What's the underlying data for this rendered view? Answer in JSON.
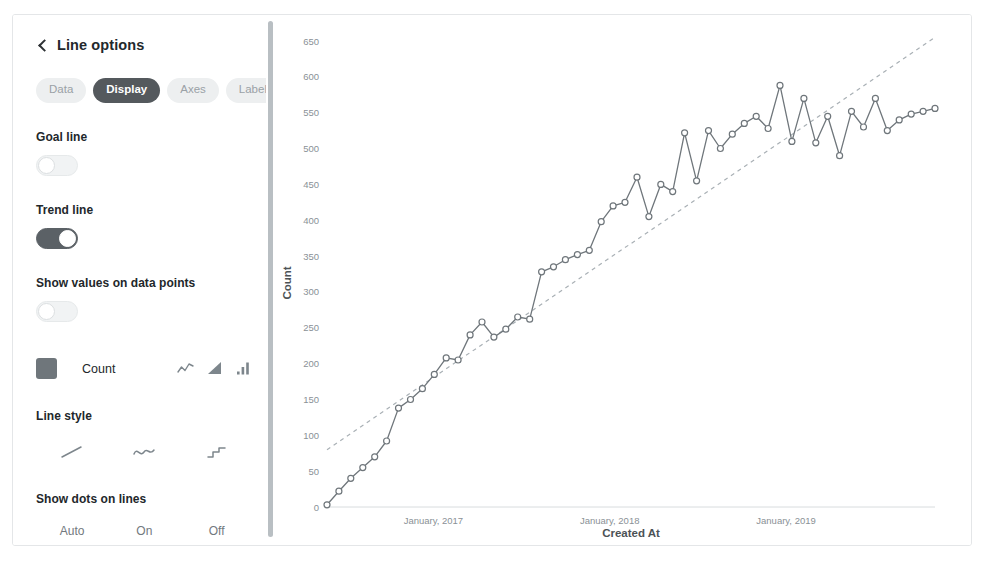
{
  "panel": {
    "title": "Line options",
    "back_icon": "chevron-left-icon",
    "tabs": [
      {
        "label": "Data",
        "active": false
      },
      {
        "label": "Display",
        "active": true
      },
      {
        "label": "Axes",
        "active": false
      },
      {
        "label": "Labels",
        "active": false
      }
    ],
    "goal_line": {
      "label": "Goal line",
      "value": "off"
    },
    "trend_line": {
      "label": "Trend line",
      "value": "on"
    },
    "show_values": {
      "label": "Show values on data points",
      "value": "off"
    },
    "series": {
      "name": "Count",
      "color": "#6f767b",
      "display_types": [
        "line-chart-icon",
        "area-chart-icon",
        "bar-chart-icon"
      ]
    },
    "line_style": {
      "label": "Line style",
      "options": [
        "linear-line-icon",
        "curve-line-icon",
        "step-line-icon"
      ]
    },
    "show_dots": {
      "label": "Show dots on lines",
      "options": [
        "Auto",
        "On",
        "Off"
      ],
      "selected": "Auto"
    },
    "replace_missing": {
      "label": "Replace missing values with"
    }
  },
  "chart_data": {
    "type": "line",
    "title": "",
    "xlabel": "Created At",
    "ylabel": "Count",
    "ylim": [
      0,
      650
    ],
    "yticks": [
      0,
      50,
      100,
      150,
      200,
      250,
      300,
      350,
      400,
      450,
      500,
      550,
      600,
      650
    ],
    "xticks": [
      "January, 2017",
      "January, 2018",
      "January, 2019"
    ],
    "xtick_positions": [
      0.175,
      0.465,
      0.755
    ],
    "grid": false,
    "legend": "none",
    "series_name": "Count",
    "line_color": "#6f767b",
    "marker": "open-circle",
    "values": [
      3,
      22,
      40,
      55,
      70,
      92,
      138,
      150,
      165,
      185,
      208,
      205,
      240,
      258,
      237,
      248,
      265,
      262,
      328,
      335,
      345,
      352,
      358,
      398,
      420,
      425,
      460,
      405,
      450,
      440,
      522,
      455,
      525,
      500,
      520,
      535,
      545,
      528,
      588,
      510,
      570,
      508,
      545,
      490,
      552,
      530,
      570,
      525,
      540,
      548,
      552,
      556
    ],
    "trend_line": {
      "type": "linear",
      "style": "dashed",
      "color": "#a9b0b5",
      "start_value": 80,
      "end_value": 655
    }
  }
}
